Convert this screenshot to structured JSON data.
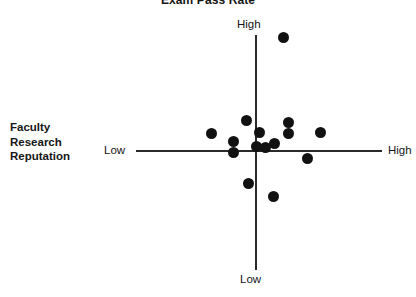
{
  "chart": {
    "title": "Exam Pass Rate",
    "y_axis_title": "Faculty\nResearch\nReputation",
    "y_axis_title_lines": [
      "Faculty",
      "Research",
      "Reputation"
    ],
    "x_label_low": "Low",
    "x_label_high": "High",
    "y_label_high": "High",
    "y_label_low": "Low"
  },
  "chart_data": {
    "type": "scatter",
    "title": "Exam Pass Rate",
    "xlabel": "Exam Pass Rate",
    "ylabel": "Faculty Research Reputation",
    "grid": false,
    "legend": null,
    "axis_style": "quadrant-crosshair",
    "xlim": [
      -1,
      1
    ],
    "ylim": [
      -1,
      1
    ],
    "x_tick_labels": [
      "Low",
      "High"
    ],
    "y_tick_labels": [
      "Low",
      "High"
    ],
    "annotations": [
      {
        "text": "Exam Pass Rate",
        "position": "top-center"
      },
      {
        "text": "Faculty Research Reputation",
        "position": "left-middle"
      },
      {
        "text": "Low",
        "position": "x-axis-left-end"
      },
      {
        "text": "High",
        "position": "x-axis-right-end"
      },
      {
        "text": "High",
        "position": "y-axis-top-end"
      },
      {
        "text": "Low",
        "position": "y-axis-bottom-end"
      }
    ],
    "point_count": 15,
    "marker": {
      "shape": "circle",
      "color": "#111111",
      "size": 11
    },
    "points": [
      {
        "px": 283,
        "py": 37,
        "x": 0.22,
        "y": 0.96
      },
      {
        "px": 211,
        "py": 133,
        "x": -0.36,
        "y": 0.15
      },
      {
        "px": 246,
        "py": 120,
        "x": -0.08,
        "y": 0.26
      },
      {
        "px": 233,
        "py": 141,
        "x": -0.19,
        "y": 0.08
      },
      {
        "px": 233,
        "py": 152,
        "x": -0.19,
        "y": -0.01
      },
      {
        "px": 259,
        "py": 132,
        "x": 0.02,
        "y": 0.16
      },
      {
        "px": 256,
        "py": 146,
        "x": 0.0,
        "y": 0.03
      },
      {
        "px": 265,
        "py": 147,
        "x": 0.07,
        "y": 0.03
      },
      {
        "px": 274,
        "py": 143,
        "x": 0.15,
        "y": 0.06
      },
      {
        "px": 288,
        "py": 122,
        "x": 0.26,
        "y": 0.24
      },
      {
        "px": 288,
        "py": 133,
        "x": 0.26,
        "y": 0.15
      },
      {
        "px": 320,
        "py": 132,
        "x": 0.52,
        "y": 0.16
      },
      {
        "px": 307,
        "py": 158,
        "x": 0.41,
        "y": -0.06
      },
      {
        "px": 248,
        "py": 183,
        "x": -0.06,
        "y": -0.28
      },
      {
        "px": 273,
        "py": 196,
        "x": 0.14,
        "y": -0.39
      }
    ]
  },
  "icons": {}
}
